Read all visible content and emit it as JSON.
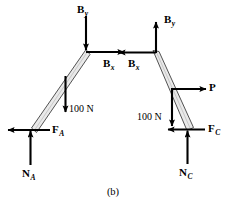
{
  "figure": {
    "caption": "(b)",
    "kind": "free-body-diagram",
    "colors": {
      "stroke": "#000000",
      "bar_fill": "#e9e9e9",
      "bar_edge": "#3a3a3a",
      "background": "#ffffff"
    }
  },
  "members": {
    "left_bar": {
      "name": "left-member-AB",
      "top_joint": {
        "x": 86,
        "y": 52
      },
      "bottom_foot": {
        "x": 33,
        "y": 130
      }
    },
    "right_bar": {
      "name": "right-member-BC",
      "top_joint": {
        "x": 156,
        "y": 53
      },
      "bottom_foot": {
        "x": 190,
        "y": 129
      }
    }
  },
  "force_labels": {
    "left_By": {
      "symbol": "B",
      "subscript": "y",
      "direction": "down"
    },
    "left_Bx": {
      "symbol": "B",
      "subscript": "x",
      "direction": "right"
    },
    "right_Bx": {
      "symbol": "B",
      "subscript": "x",
      "direction": "left"
    },
    "right_By": {
      "symbol": "B",
      "subscript": "y",
      "direction": "up"
    },
    "left_weight": {
      "text": "100 N",
      "direction": "down"
    },
    "right_weight": {
      "text": "100 N",
      "direction": "down"
    },
    "applied_P": {
      "symbol": "P",
      "subscript": "",
      "direction": "right"
    },
    "friction_A": {
      "symbol": "F",
      "subscript": "A",
      "direction": "left"
    },
    "normal_A": {
      "symbol": "N",
      "subscript": "A",
      "direction": "up"
    },
    "friction_C": {
      "symbol": "F",
      "subscript": "C",
      "direction": "left"
    },
    "normal_C": {
      "symbol": "N",
      "subscript": "C",
      "direction": "up"
    }
  }
}
